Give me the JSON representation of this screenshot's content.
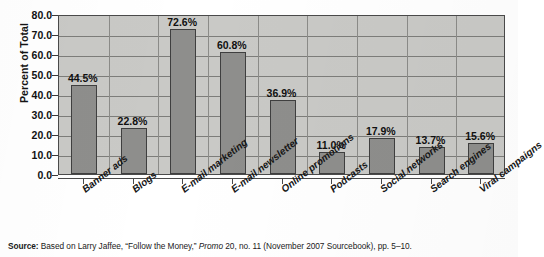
{
  "chart_data": {
    "type": "bar",
    "title": "",
    "xlabel": "",
    "ylabel": "Percent of Total",
    "ylim": [
      0,
      80
    ],
    "ytick_step": 10,
    "ytick_labels": [
      "0.0",
      "10.0",
      "20.0",
      "30.0",
      "40.0",
      "50.0",
      "60.0",
      "70.0",
      "80.0"
    ],
    "grid": true,
    "legend": "none",
    "value_suffix": "%",
    "categories": [
      "Banner ads",
      "Blogs",
      "E-mail marketing",
      "E-mail newsletter",
      "Online promotions",
      "Podcasts",
      "Social networks",
      "Search engines",
      "Viral campaigns"
    ],
    "values": [
      44.5,
      22.8,
      72.6,
      60.8,
      36.9,
      11.0,
      17.9,
      13.7,
      15.6
    ],
    "value_labels": [
      "44.5%",
      "22.8%",
      "72.6%",
      "60.8%",
      "36.9%",
      "11.0%",
      "17.9%",
      "13.7%",
      "15.6%"
    ],
    "colors": {
      "bar_fill": "#8e8e8c",
      "bar_border": "#3f3f3f",
      "plot_background": "#c9c9c6",
      "gridline": "#7d7d7a",
      "axis": "#4a4a4a",
      "text": "#111111"
    }
  },
  "source": {
    "label": "Source:",
    "text_before_italic": " Based on Larry Jaffee, “Follow the Money,” ",
    "italic_text": "Promo",
    "text_after_italic": " 20, no. 11 (November 2007 Sourcebook), pp. 5–10."
  }
}
